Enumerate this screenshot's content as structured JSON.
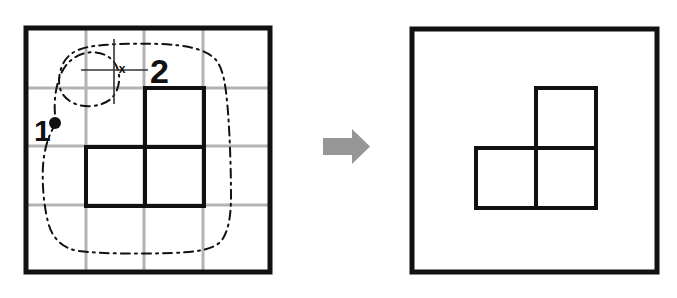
{
  "figure": {
    "title": "Grid region outline to extracted polyomino shape",
    "background_color": "#ffffff",
    "width": 677,
    "height": 298
  },
  "colors": {
    "panel_border": "#111111",
    "grid_line": "#b3b3b3",
    "shape_stroke": "#111111",
    "dashed_outline": "#111111",
    "arrow_fill": "#969696",
    "label_text": "#111111",
    "marker_fill": "#111111",
    "crosshair_line": "#333333"
  },
  "left_panel": {
    "name": "source-grid-panel",
    "frame": {
      "x": 26,
      "y": 28,
      "width": 244,
      "height": 244,
      "stroke_width": 5
    },
    "grid": {
      "columns": 4,
      "rows": 4,
      "cell_size": 59,
      "stroke_width": 3,
      "vertical_lines_x": [
        86,
        144,
        203
      ],
      "horizontal_lines_y": [
        88,
        146,
        205
      ]
    },
    "shape": {
      "name": "l-tromino",
      "cells": [
        {
          "col": 2,
          "row": 1
        },
        {
          "col": 1,
          "row": 2
        },
        {
          "col": 2,
          "row": 2
        }
      ],
      "stroke_width": 4,
      "origin_x": 86,
      "origin_y": 88,
      "cell_size": 59
    },
    "dashed_outline": {
      "name": "freehand-region-outline",
      "style": "dash-dot",
      "stroke_width": 2
    },
    "annotations": [
      {
        "id": "label-1",
        "name": "annotation-label-1",
        "text": "1",
        "x": 34,
        "y": 141,
        "font_size": 30,
        "font_weight": "bold",
        "marker": {
          "name": "start-point-dot",
          "shape": "filled-circle",
          "cx": 55,
          "cy": 123,
          "r": 6
        }
      },
      {
        "id": "label-2",
        "name": "annotation-label-2",
        "text": "2",
        "x": 150,
        "y": 83,
        "font_size": 34,
        "font_weight": "bold",
        "marker": {
          "name": "crosshair-marker",
          "shape": "crosshair-with-x",
          "x_glyph": "x",
          "x_glyph_x": 122,
          "x_glyph_y": 70,
          "vertical_line": {
            "x": 114,
            "y1": 39,
            "y2": 104
          },
          "horizontal_line": {
            "y": 70,
            "x1": 81,
            "x2": 148
          }
        }
      }
    ]
  },
  "arrow": {
    "name": "transform-arrow",
    "direction": "right",
    "x": 323,
    "y": 129,
    "width": 47,
    "height": 35,
    "fill": "#969696"
  },
  "right_panel": {
    "name": "result-shape-panel",
    "frame": {
      "x": 412,
      "y": 29,
      "width": 245,
      "height": 243,
      "stroke_width": 5
    },
    "grid": {
      "visible": false,
      "columns": 0,
      "rows": 0
    },
    "shape": {
      "name": "l-tromino",
      "cells": [
        {
          "col": 2,
          "row": 1
        },
        {
          "col": 1,
          "row": 2
        },
        {
          "col": 2,
          "row": 2
        }
      ],
      "stroke_width": 4,
      "origin_x": 476,
      "origin_y": 88,
      "cell_size": 60
    },
    "dashed_outline": {
      "visible": false
    },
    "annotations": []
  }
}
